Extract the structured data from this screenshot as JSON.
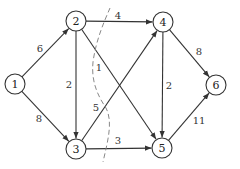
{
  "diagram": {
    "type": "directed-weighted-graph",
    "nodes": [
      {
        "id": "1",
        "label": "1",
        "x": 15,
        "y": 84
      },
      {
        "id": "2",
        "label": "2",
        "x": 76,
        "y": 21
      },
      {
        "id": "3",
        "label": "3",
        "x": 76,
        "y": 149
      },
      {
        "id": "4",
        "label": "4",
        "x": 163,
        "y": 22
      },
      {
        "id": "5",
        "label": "5",
        "x": 162,
        "y": 148
      },
      {
        "id": "6",
        "label": "6",
        "x": 216,
        "y": 85
      }
    ],
    "edges": [
      {
        "from": "1",
        "to": "2",
        "weight": "6",
        "label_x": 40,
        "label_y": 48
      },
      {
        "from": "1",
        "to": "3",
        "weight": "8",
        "label_x": 39,
        "label_y": 118
      },
      {
        "from": "2",
        "to": "3",
        "weight": "2",
        "label_x": 69,
        "label_y": 84
      },
      {
        "from": "2",
        "to": "4",
        "weight": "4",
        "label_x": 118,
        "label_y": 15
      },
      {
        "from": "2",
        "to": "5",
        "weight": "1",
        "label_x": 99,
        "label_y": 67
      },
      {
        "from": "3",
        "to": "4",
        "weight": "5",
        "label_x": 96,
        "label_y": 107
      },
      {
        "from": "3",
        "to": "5",
        "weight": "3",
        "label_x": 118,
        "label_y": 140
      },
      {
        "from": "4",
        "to": "5",
        "weight": "2",
        "label_x": 169,
        "label_y": 85
      },
      {
        "from": "4",
        "to": "6",
        "weight": "8",
        "label_x": 199,
        "label_y": 51
      },
      {
        "from": "5",
        "to": "6",
        "weight": "11",
        "label_x": 199,
        "label_y": 120
      }
    ],
    "cut": {
      "style": "dashed",
      "path": "M110,8 C104,22 96,40 93,62 C91,82 98,96 106,108 C113,122 108,140 103,162"
    },
    "colors": {
      "stroke": "#333333",
      "cut": "#888888",
      "background": "#ffffff"
    }
  }
}
